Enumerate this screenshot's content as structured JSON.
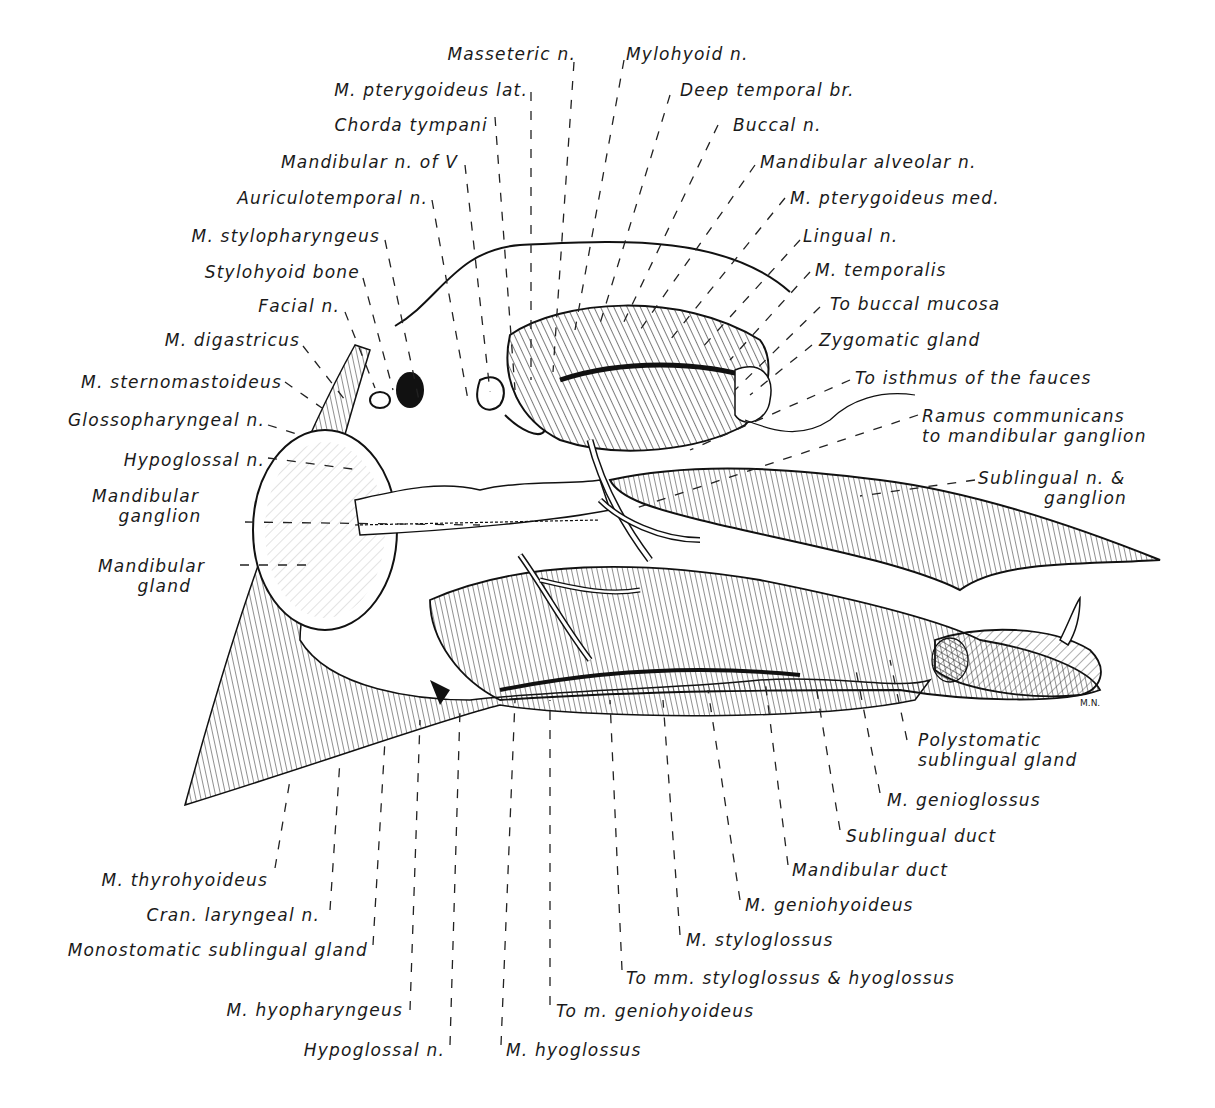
{
  "figure": {
    "signature": "M.N.",
    "colors": {
      "ink": "#1a1a1a",
      "paper": "#ffffff"
    }
  },
  "labels": {
    "top": [
      {
        "id": "masseteric_n",
        "text": "Masseteric n."
      },
      {
        "id": "m_pterygoideus_lat",
        "text": "M. pterygoideus lat."
      },
      {
        "id": "chorda_tympani",
        "text": "Chorda tympani"
      },
      {
        "id": "mandibular_n_of_v",
        "text": "Mandibular n. of V"
      },
      {
        "id": "auriculotemporal_n",
        "text": "Auriculotemporal n."
      },
      {
        "id": "m_stylopharyngeus",
        "text": "M. stylopharyngeus"
      },
      {
        "id": "stylohyoid_bone",
        "text": "Stylohyoid bone"
      },
      {
        "id": "facial_n",
        "text": "Facial n."
      }
    ],
    "left": [
      {
        "id": "m_digastricus",
        "text": "M. digastricus"
      },
      {
        "id": "m_sternomastoideus",
        "text": "M. sternomastoideus"
      },
      {
        "id": "glossopharyngeal_n",
        "text": "Glossopharyngeal n."
      },
      {
        "id": "hypoglossal_n_upper",
        "text": "Hypoglossal n."
      },
      {
        "id": "mandibular_ganglion",
        "text": "Mandibular\n    ganglion"
      },
      {
        "id": "mandibular_gland",
        "text": "Mandibular\n      gland"
      }
    ],
    "right": [
      {
        "id": "mylohyoid_n",
        "text": "Mylohyoid n."
      },
      {
        "id": "deep_temporal_br",
        "text": "Deep temporal br."
      },
      {
        "id": "buccal_n",
        "text": "Buccal n."
      },
      {
        "id": "mandibular_alveolar_n",
        "text": "Mandibular alveolar n."
      },
      {
        "id": "m_pterygoideus_med",
        "text": "M. pterygoideus med."
      },
      {
        "id": "lingual_n",
        "text": "Lingual n."
      },
      {
        "id": "m_temporalis",
        "text": "M. temporalis"
      },
      {
        "id": "to_buccal_mucosa",
        "text": "To buccal mucosa"
      },
      {
        "id": "zygomatic_gland",
        "text": "Zygomatic gland"
      },
      {
        "id": "to_isthmus_of_fauces",
        "text": "To isthmus of the fauces"
      },
      {
        "id": "ramus_communicans",
        "text": "Ramus communicans\nto mandibular ganglion"
      },
      {
        "id": "sublingual_n_ganglion",
        "text": "Sublingual n. & \n          ganglion"
      }
    ],
    "bottom_right": [
      {
        "id": "polystomatic_sublingual_gland",
        "text": "Polystomatic\nsublingual gland"
      },
      {
        "id": "m_genioglossus",
        "text": "M. genioglossus"
      },
      {
        "id": "sublingual_duct",
        "text": "Sublingual duct"
      },
      {
        "id": "mandibular_duct",
        "text": "Mandibular duct"
      },
      {
        "id": "m_geniohyoideus",
        "text": "M. geniohyoideus"
      },
      {
        "id": "m_styloglossus",
        "text": "M. styloglossus"
      },
      {
        "id": "to_mm_styloglossus_hyoglossus",
        "text": "To mm. styloglossus & hyoglossus"
      },
      {
        "id": "to_m_geniohyoideus",
        "text": "To m. geniohyoideus"
      },
      {
        "id": "m_hyoglossus",
        "text": "M. hyoglossus"
      }
    ],
    "bottom_left": [
      {
        "id": "m_thyrohyoideus",
        "text": "M. thyrohyoideus"
      },
      {
        "id": "cran_laryngeal_n",
        "text": "Cran. laryngeal n."
      },
      {
        "id": "monostomatic_sublingual_gland",
        "text": "Monostomatic sublingual gland"
      },
      {
        "id": "m_hyopharyngeus",
        "text": "M. hyopharyngeus"
      },
      {
        "id": "hypoglossal_n_lower",
        "text": "Hypoglossal n."
      }
    ]
  }
}
